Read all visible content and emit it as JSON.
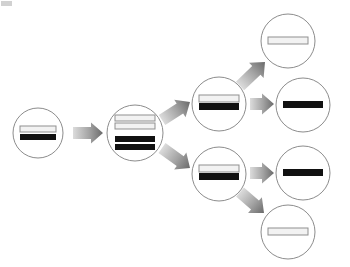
{
  "diagram": {
    "type": "node-link-tree",
    "canvas": {
      "width": 350,
      "height": 267,
      "background": "#ffffff"
    },
    "style": {
      "circle_stroke": "#8c8c8c",
      "circle_stroke_width": 1,
      "circle_fill": "#ffffff",
      "bar_light_fill": "#f2f2f2",
      "bar_light_stroke": "#8f8f8f",
      "bar_dark_fill": "#111111",
      "arrow_gradient_start": "#d8d8d8",
      "arrow_gradient_end": "#6e6e6e"
    },
    "nodes": [
      {
        "id": "n1",
        "name": "node-generation-1",
        "label": "Generation 1 cell",
        "column": 1,
        "cx": 38,
        "cy": 133,
        "r": 25,
        "bars": [
          {
            "tone": "light",
            "x": -18,
            "y": -7,
            "w": 36,
            "h": 6
          },
          {
            "tone": "dark",
            "x": -18,
            "y": 1,
            "w": 36,
            "h": 6
          }
        ],
        "light_bar_count": 1,
        "dark_bar_count": 1
      },
      {
        "id": "n2",
        "name": "node-generation-2",
        "label": "Generation 2 cell",
        "column": 2,
        "cx": 135,
        "cy": 133,
        "r": 28,
        "bars": [
          {
            "tone": "light",
            "x": -20,
            "y": -18,
            "w": 40,
            "h": 6
          },
          {
            "tone": "light",
            "x": -20,
            "y": -10,
            "w": 40,
            "h": 6
          },
          {
            "tone": "dark",
            "x": -20,
            "y": 3,
            "w": 40,
            "h": 6
          },
          {
            "tone": "dark",
            "x": -20,
            "y": 11,
            "w": 40,
            "h": 6
          }
        ],
        "light_bar_count": 2,
        "dark_bar_count": 2
      },
      {
        "id": "n3a",
        "name": "node-generation-3-upper",
        "label": "Generation 3 upper cell",
        "column": 3,
        "cx": 219,
        "cy": 104,
        "r": 27,
        "bars": [
          {
            "tone": "light",
            "x": -20,
            "y": -9,
            "w": 40,
            "h": 7
          },
          {
            "tone": "dark",
            "x": -20,
            "y": -1,
            "w": 40,
            "h": 7
          }
        ],
        "light_bar_count": 1,
        "dark_bar_count": 1
      },
      {
        "id": "n3b",
        "name": "node-generation-3-lower",
        "label": "Generation 3 lower cell",
        "column": 3,
        "cx": 219,
        "cy": 174,
        "r": 27,
        "bars": [
          {
            "tone": "light",
            "x": -20,
            "y": -9,
            "w": 40,
            "h": 7
          },
          {
            "tone": "dark",
            "x": -20,
            "y": -1,
            "w": 40,
            "h": 7
          }
        ],
        "light_bar_count": 1,
        "dark_bar_count": 1
      },
      {
        "id": "n4a",
        "name": "node-generation-4-first",
        "label": "Generation 4 cell, light strand only",
        "column": 4,
        "cx": 288,
        "cy": 41,
        "r": 27,
        "bars": [
          {
            "tone": "light",
            "x": -20,
            "y": -4,
            "w": 40,
            "h": 7
          }
        ],
        "light_bar_count": 1,
        "dark_bar_count": 0
      },
      {
        "id": "n4b",
        "name": "node-generation-4-second",
        "label": "Generation 4 cell, dark strand only",
        "column": 4,
        "cx": 303,
        "cy": 105,
        "r": 27,
        "bars": [
          {
            "tone": "dark",
            "x": -20,
            "y": -4,
            "w": 40,
            "h": 7
          }
        ],
        "light_bar_count": 0,
        "dark_bar_count": 1
      },
      {
        "id": "n4c",
        "name": "node-generation-4-third",
        "label": "Generation 4 cell, dark strand only",
        "column": 4,
        "cx": 303,
        "cy": 173,
        "r": 27,
        "bars": [
          {
            "tone": "dark",
            "x": -20,
            "y": -4,
            "w": 40,
            "h": 7
          }
        ],
        "light_bar_count": 0,
        "dark_bar_count": 1
      },
      {
        "id": "n4d",
        "name": "node-generation-4-fourth",
        "label": "Generation 4 cell, light strand only",
        "column": 4,
        "cx": 288,
        "cy": 232,
        "r": 27,
        "bars": [
          {
            "tone": "light",
            "x": -20,
            "y": -4,
            "w": 40,
            "h": 7
          }
        ],
        "light_bar_count": 1,
        "dark_bar_count": 0
      }
    ],
    "arrows": [
      {
        "id": "a1",
        "name": "arrow-gen1-to-gen2",
        "from": "n1",
        "to": "n2",
        "x1": 73,
        "y1": 133,
        "x2": 103,
        "y2": 133
      },
      {
        "id": "a2",
        "name": "arrow-gen2-to-gen3-upper",
        "from": "n2",
        "to": "n3a",
        "x1": 162,
        "y1": 120,
        "x2": 190,
        "y2": 102
      },
      {
        "id": "a3",
        "name": "arrow-gen2-to-gen3-lower",
        "from": "n2",
        "to": "n3b",
        "x1": 162,
        "y1": 148,
        "x2": 190,
        "y2": 168
      },
      {
        "id": "a4",
        "name": "arrow-gen3-upper-to-gen4-first",
        "from": "n3a",
        "to": "n4a",
        "x1": 240,
        "y1": 86,
        "x2": 265,
        "y2": 62
      },
      {
        "id": "a5",
        "name": "arrow-gen3-upper-to-gen4-second",
        "from": "n3a",
        "to": "n4b",
        "x1": 250,
        "y1": 104,
        "x2": 274,
        "y2": 104
      },
      {
        "id": "a6",
        "name": "arrow-gen3-lower-to-gen4-third",
        "from": "n3b",
        "to": "n4c",
        "x1": 250,
        "y1": 173,
        "x2": 274,
        "y2": 173
      },
      {
        "id": "a7",
        "name": "arrow-gen3-lower-to-gen4-fourth",
        "from": "n3b",
        "to": "n4d",
        "x1": 240,
        "y1": 192,
        "x2": 264,
        "y2": 213
      }
    ]
  }
}
